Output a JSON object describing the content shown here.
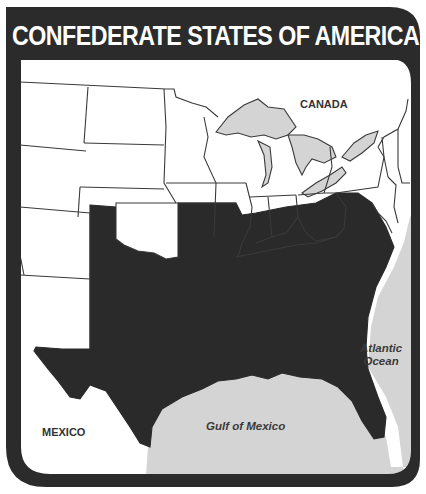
{
  "map": {
    "title": "CONFEDERATE STATES OF AMERICA",
    "labels": {
      "canada": "CANADA",
      "mexico": "MEXICO",
      "gulf": "Gulf of Mexico",
      "atlantic_line1": "Atlantic",
      "atlantic_line2": "Ocean"
    },
    "legend_meaning": {
      "confederate_states_fill": "#2a2a2a",
      "union_and_territories_fill": "#ffffff",
      "water_fill": "#d4d4d4",
      "frame_color": "#2b2b2b"
    },
    "highlighted_region": "Confederate States (shaded dark)"
  }
}
